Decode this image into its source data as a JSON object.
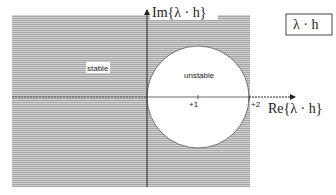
{
  "diagram": {
    "axes": {
      "real_axis_label": "Re{λ · h}",
      "imag_axis_label": "Im{λ · h}"
    },
    "box_label": "λ · h",
    "regions": {
      "stable_label": "stable",
      "unstable_label": "unstable"
    },
    "ticks": [
      {
        "label": "+1",
        "value": 1
      },
      {
        "label": "+2",
        "value": 2
      }
    ],
    "circle": {
      "center_re": 1,
      "center_im": 0,
      "radius": 1
    },
    "colors": {
      "shade": "#b8b8b8",
      "axis": "#333333",
      "background": "#ffffff"
    }
  }
}
